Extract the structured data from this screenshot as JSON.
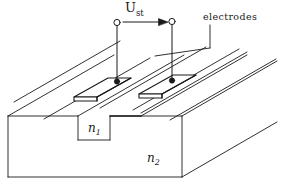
{
  "figure": {
    "background_color": "#ffffff",
    "line_color": "#1a1a1a",
    "fill_color": "#ffffff"
  },
  "labels": {
    "voltage": {
      "symbol": "U",
      "subscript": "st"
    },
    "electrodes": {
      "text": "electrodes"
    },
    "index_guide": {
      "symbol": "n",
      "subscript": "1"
    },
    "index_substrate": {
      "symbol": "n",
      "subscript": "2"
    }
  },
  "annotations": {
    "arrow": {
      "name": "voltage-direction-arrow",
      "direction": "right"
    },
    "leader": {
      "name": "electrodes-leader-line"
    }
  },
  "terminals": [
    {
      "name": "terminal-left",
      "style": "open-circle"
    },
    {
      "name": "terminal-right",
      "style": "open-circle"
    }
  ],
  "contacts": [
    {
      "name": "contact-left",
      "style": "filled-dot"
    },
    {
      "name": "contact-right",
      "style": "filled-dot"
    }
  ],
  "electrodes": [
    {
      "name": "electrode-plate-left"
    },
    {
      "name": "electrode-plate-right"
    }
  ],
  "structure": {
    "substrate": {
      "name": "substrate-block"
    },
    "ridge": {
      "name": "ridge-waveguide"
    }
  }
}
